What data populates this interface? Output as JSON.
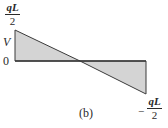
{
  "diagram": {
    "type": "shear-force-diagram",
    "caption": "(b)",
    "axis_label": "V",
    "zero_label": "0",
    "top_value": {
      "numerator": "qL",
      "denominator": "2"
    },
    "bottom_value": {
      "sign": "−",
      "numerator": "qL",
      "denominator": "2"
    },
    "colors": {
      "fill": "#d4d4d4",
      "stroke": "#3a3a3a"
    }
  }
}
